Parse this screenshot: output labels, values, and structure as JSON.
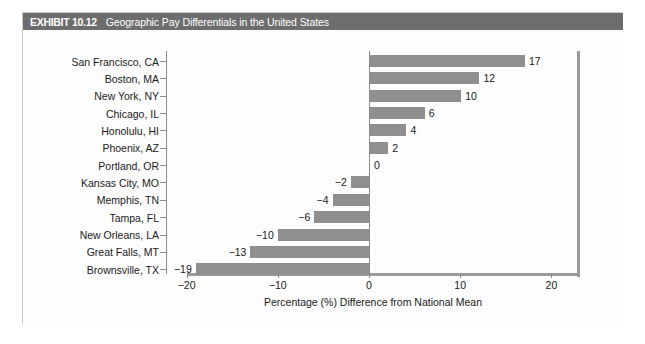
{
  "exhibit": {
    "number": "EXHIBIT 10.12",
    "title": "Geographic Pay Differentials in the United States"
  },
  "chart_data": {
    "type": "bar",
    "orientation": "horizontal",
    "title": "Geographic Pay Differentials in the United States",
    "xlabel": "Percentage (%) Difference from National Mean",
    "ylabel": "",
    "xlim": [
      -22,
      22
    ],
    "xticks": [
      -20,
      -10,
      0,
      10,
      20
    ],
    "xtick_labels": [
      "−20",
      "−10",
      "0",
      "10",
      "20"
    ],
    "grid": false,
    "legend": false,
    "bar_color": "#8f8f8f",
    "categories": [
      "San Francisco, CA",
      "Boston, MA",
      "New York, NY",
      "Chicago, IL",
      "Honolulu, HI",
      "Phoenix, AZ",
      "Portland, OR",
      "Kansas City, MO",
      "Memphis, TN",
      "Tampa, FL",
      "New Orleans, LA",
      "Great Falls, MT",
      "Brownsville, TX"
    ],
    "values": [
      17,
      12,
      10,
      6,
      4,
      2,
      0,
      -2,
      -4,
      -6,
      -10,
      -13,
      -19
    ],
    "value_labels": [
      "17",
      "12",
      "10",
      "6",
      "4",
      "2",
      "0",
      "−2",
      "−4",
      "−6",
      "−10",
      "−13",
      "−19"
    ]
  }
}
